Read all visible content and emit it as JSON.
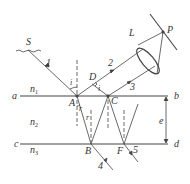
{
  "diagram": {
    "source_label": "S",
    "lens_label": "L",
    "screen_point_label": "P",
    "interfaces": [
      {
        "left": "a",
        "right": "b"
      },
      {
        "left": "c",
        "right": "d"
      }
    ],
    "media": [
      "n",
      "n",
      "n"
    ],
    "media_subscripts": [
      "1",
      "2",
      "3"
    ],
    "points": {
      "A": "A",
      "B": "B",
      "C": "C",
      "D": "D",
      "F": "F"
    },
    "rays": [
      "1",
      "2",
      "3",
      "4",
      "5"
    ],
    "angles": {
      "incidence": "i",
      "refraction": "r"
    },
    "thickness_label": "e",
    "colors": {
      "line": "#444444",
      "background": "#ffffff"
    }
  }
}
